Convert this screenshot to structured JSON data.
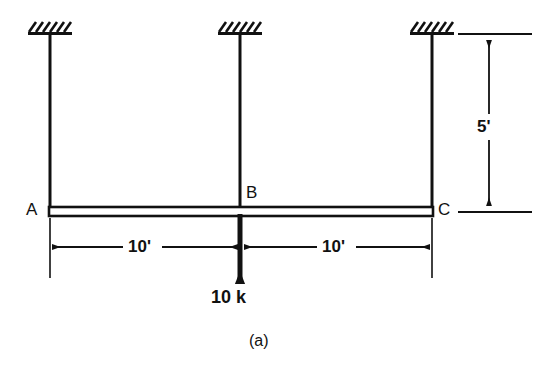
{
  "figure": {
    "caption": "(a)",
    "stroke_color": "#111111",
    "background_color": "#ffffff"
  },
  "joints": {
    "left": "A",
    "center": "B",
    "right": "C"
  },
  "dimensions": {
    "span_left": "10'",
    "span_right": "10'",
    "column_height": "5'"
  },
  "load": {
    "magnitude": "10 k",
    "direction": "down",
    "location": "B"
  },
  "supports": {
    "type": "fixed",
    "count": 3,
    "hatch_style": "diagonal"
  }
}
